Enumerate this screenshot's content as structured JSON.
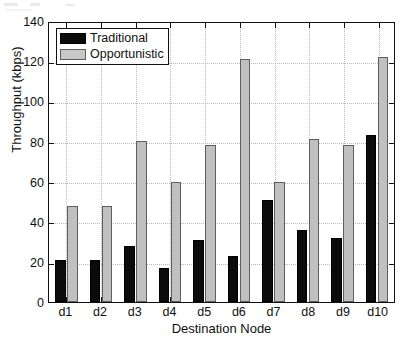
{
  "chart_data": {
    "type": "bar",
    "title": "",
    "subtitle": "",
    "xlabel": "Destination Node",
    "ylabel": "Throughput (kbps)",
    "categories": [
      "d1",
      "d2",
      "d3",
      "d4",
      "d5",
      "d6",
      "d7",
      "d8",
      "d9",
      "d10"
    ],
    "series": [
      {
        "name": "Traditional",
        "color": "#0b0b0b",
        "values": [
          21,
          21,
          28,
          17,
          31,
          23,
          51,
          36,
          32,
          84
        ]
      },
      {
        "name": "Opportunistic",
        "color": "#c0c0c0",
        "values": [
          48,
          48,
          81,
          60,
          79,
          122,
          60,
          82,
          79,
          123
        ]
      }
    ],
    "ylim": [
      0,
      140
    ],
    "yticks": [
      0,
      20,
      40,
      60,
      80,
      100,
      120,
      140
    ],
    "ytick_labels": [
      "0",
      "20",
      "40",
      "60",
      "80",
      "100",
      "120",
      "140"
    ],
    "grid": true,
    "grid_style": "dotted",
    "legend_position": "top-left",
    "legend_entries": [
      "Traditional",
      "Opportunistic"
    ]
  },
  "figure": {
    "background": "#ffffff",
    "axis_color": "#101010",
    "grid_color": "#b9b9b9"
  }
}
